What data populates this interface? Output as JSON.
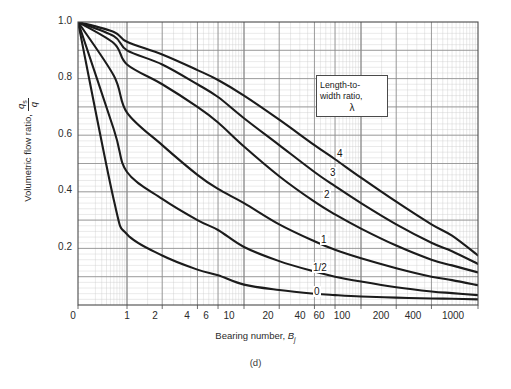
{
  "figure": {
    "caption": "(d)",
    "xlabel_main": "Bearing number, ",
    "xlabel_sym": "B",
    "xlabel_sub": "j",
    "ylabel_main": "Volumetric flow ratio, ",
    "ylabel_num": "q",
    "ylabel_num_sub": "s",
    "ylabel_den": "q"
  },
  "legend": {
    "line1": "Length-to-",
    "line2": "width ratio,",
    "symbol": "λ"
  },
  "chart_data": {
    "type": "line",
    "title": "",
    "subtitle": "",
    "xlabel": "Bearing number, Bj",
    "ylabel": "Volumetric flow ratio, qs/q",
    "xscale": "log-like (0 then log from 1 to 1000)",
    "yscale": "linear",
    "xlim": [
      0,
      1000
    ],
    "ylim": [
      0,
      1.0
    ],
    "grid": true,
    "grid_minor": true,
    "legend_position": "inside-upper-right",
    "legend_title": "Length-to-width ratio, λ",
    "xticks": [
      "0",
      "1",
      "2",
      "4",
      "6",
      "10",
      "20",
      "40",
      "60",
      "100",
      "200",
      "400",
      "1000"
    ],
    "xtick_values": [
      0,
      1,
      2,
      4,
      6,
      10,
      20,
      40,
      60,
      100,
      200,
      400,
      1000
    ],
    "yticks": [
      "1.0",
      "0.8",
      "0.6",
      "0.4",
      "0.2"
    ],
    "ytick_values": [
      1.0,
      0.8,
      0.6,
      0.4,
      0.2
    ],
    "x": [
      0,
      0.5,
      1,
      2,
      4,
      6,
      10,
      20,
      40,
      60,
      100,
      200,
      400,
      600,
      1000
    ],
    "series": [
      {
        "name": "4",
        "label": "4",
        "values": [
          1.0,
          0.965,
          0.93,
          0.885,
          0.83,
          0.795,
          0.74,
          0.655,
          0.565,
          0.515,
          0.45,
          0.365,
          0.285,
          0.245,
          0.175
        ]
      },
      {
        "name": "3",
        "label": "3",
        "values": [
          1.0,
          0.95,
          0.9,
          0.85,
          0.78,
          0.735,
          0.66,
          0.565,
          0.47,
          0.42,
          0.36,
          0.285,
          0.22,
          0.19,
          0.145
        ]
      },
      {
        "name": "2",
        "label": "2",
        "values": [
          1.0,
          0.925,
          0.85,
          0.78,
          0.7,
          0.645,
          0.56,
          0.455,
          0.365,
          0.32,
          0.27,
          0.21,
          0.16,
          0.14,
          0.115
        ]
      },
      {
        "name": "1",
        "label": "1",
        "values": [
          1.0,
          0.81,
          0.68,
          0.565,
          0.46,
          0.41,
          0.36,
          0.285,
          0.225,
          0.195,
          0.165,
          0.13,
          0.1,
          0.088,
          0.07
        ]
      },
      {
        "name": "1/2",
        "label": "1/2",
        "values": [
          1.0,
          0.62,
          0.47,
          0.375,
          0.3,
          0.265,
          0.205,
          0.155,
          0.118,
          0.1,
          0.083,
          0.063,
          0.048,
          0.042,
          0.035
        ]
      },
      {
        "name": "0",
        "label": "0",
        "values": [
          1.0,
          0.37,
          0.25,
          0.175,
          0.125,
          0.105,
          0.072,
          0.053,
          0.04,
          0.035,
          0.03,
          0.026,
          0.023,
          0.022,
          0.02
        ]
      }
    ]
  },
  "curve_labels": [
    {
      "text": "4",
      "left": 336,
      "top": 148
    },
    {
      "text": "3",
      "left": 329,
      "top": 167
    },
    {
      "text": "2",
      "left": 323,
      "top": 189
    },
    {
      "text": "1",
      "left": 320,
      "top": 234
    },
    {
      "text": "1/2",
      "left": 312,
      "top": 262
    },
    {
      "text": "0",
      "left": 313,
      "top": 286
    }
  ],
  "ytick_positions": [
    {
      "text": "1.0",
      "top": 15
    },
    {
      "text": "0.8",
      "top": 71
    },
    {
      "text": "0.6",
      "top": 128
    },
    {
      "text": "0.4",
      "top": 184
    },
    {
      "text": "0.2",
      "top": 241
    }
  ],
  "xtick_positions": [
    {
      "text": "0",
      "left": 58
    },
    {
      "text": "1",
      "left": 112
    },
    {
      "text": "2",
      "left": 140
    },
    {
      "text": "4",
      "left": 172
    },
    {
      "text": "6",
      "left": 191
    },
    {
      "text": "10",
      "left": 214
    },
    {
      "text": "20",
      "left": 253
    },
    {
      "text": "40",
      "left": 285
    },
    {
      "text": "60",
      "left": 304
    },
    {
      "text": "100",
      "left": 327
    },
    {
      "text": "200",
      "left": 366
    },
    {
      "text": "400",
      "left": 398
    },
    {
      "text": "1000",
      "left": 438
    }
  ]
}
